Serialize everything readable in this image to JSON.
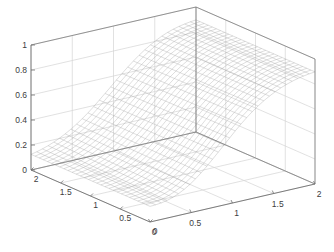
{
  "figure": {
    "background_color": "#ffffff",
    "axis_line_color": "#707070",
    "grid_color": "#d4d4d4",
    "mesh_color": "#999999",
    "tick_label_color": "#404040"
  },
  "chart_data": {
    "type": "surface",
    "title": "",
    "xlabel": "",
    "ylabel": "",
    "zlabel": "",
    "grid": true,
    "legend": null,
    "projection": "3d-mesh",
    "xlim": [
      0,
      2
    ],
    "ylim": [
      0,
      2
    ],
    "zlim": [
      0,
      1
    ],
    "xticks": [
      0,
      0.5,
      1,
      1.5,
      2
    ],
    "yticks": [
      0,
      0.5,
      1,
      1.5,
      2
    ],
    "zticks": [
      0,
      0.2,
      0.4,
      0.6,
      0.8,
      1
    ],
    "xtick_labels": [
      "0",
      "0.5",
      "1",
      "1.5",
      "2"
    ],
    "ytick_labels": [
      "0",
      "0.5",
      "1",
      "1.5",
      "2"
    ],
    "ztick_labels": [
      "0",
      "0.2",
      "0.4",
      "0.6",
      "0.8",
      "1"
    ],
    "mesh_n": 30,
    "z_min_observed": 0.12,
    "z_max_observed": 0.9,
    "surface_note": "monotonic ridge rising from z~0.12 at x=0 to z~0.9 at x=2, nearly constant along y",
    "z_profile_x": [
      0,
      0.069,
      0.138,
      0.207,
      0.276,
      0.345,
      0.414,
      0.483,
      0.552,
      0.621,
      0.69,
      0.759,
      0.828,
      0.897,
      0.966,
      1.034,
      1.103,
      1.172,
      1.241,
      1.31,
      1.379,
      1.448,
      1.517,
      1.586,
      1.655,
      1.724,
      1.793,
      1.862,
      1.931,
      2.0
    ],
    "z_profile_z": [
      0.125,
      0.131,
      0.14,
      0.152,
      0.168,
      0.188,
      0.212,
      0.24,
      0.272,
      0.308,
      0.347,
      0.389,
      0.433,
      0.478,
      0.522,
      0.567,
      0.61,
      0.651,
      0.689,
      0.724,
      0.756,
      0.784,
      0.809,
      0.831,
      0.849,
      0.864,
      0.876,
      0.885,
      0.892,
      0.897
    ],
    "y_tilt": [
      0.0,
      0.004,
      0.008,
      0.011,
      0.013,
      0.014,
      0.014,
      0.013,
      0.011,
      0.008,
      0.005,
      0.002,
      0.0,
      -0.002,
      -0.004,
      -0.005,
      -0.006,
      -0.006,
      -0.006,
      -0.005,
      -0.004,
      -0.003,
      -0.002,
      -0.001,
      0.0,
      0.0,
      0.0,
      0.0,
      0.0,
      0.0
    ]
  },
  "view": {
    "corner_origin_px": [
      150,
      222
    ],
    "corner_right_px": [
      315,
      184
    ],
    "corner_left_px": [
      31,
      170
    ],
    "corner_back_px": [
      190,
      10
    ],
    "z_top_px": 43,
    "z_bottom_px": 168,
    "z_axis_x_px": 31
  }
}
